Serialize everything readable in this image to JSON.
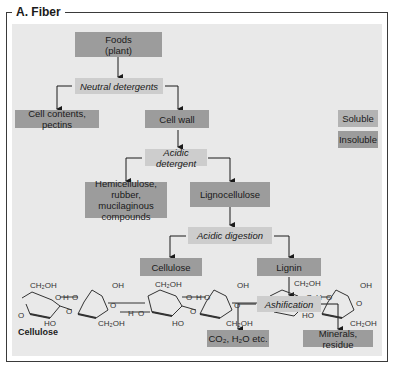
{
  "figure": {
    "title": "A. Fiber",
    "colors": {
      "panel_bg": "#e9e9e9",
      "insoluble_box": "#9c9c9c",
      "soluble_box": "#b3b3b3",
      "process_box": "#cdcdcd",
      "line": "#1a1a1a"
    }
  },
  "nodes": {
    "foods": "Foods\n(plant)",
    "neutral_detergents": "Neutral detergents",
    "cell_contents": "Cell contents, pectins",
    "cell_wall": "Cell wall",
    "acidic_detergent": "Acidic detergent",
    "hemicellulose": "Hemicellulose, rubber, mucilaginous compounds",
    "lignocellulose": "Lignocellulose",
    "acidic_digestion": "Acidic digestion",
    "cellulose": "Cellulose",
    "lignin": "Lignin",
    "ashification": "Ashification",
    "co2_h2o": "CO₂, H₂O etc.",
    "minerals": "Minerals, residue"
  },
  "legend": {
    "soluble": "Soluble",
    "insoluble": "Insoluble"
  },
  "structure": {
    "label": "Cellulose",
    "groups": [
      "CH₂OH",
      "OH",
      "HO",
      "O",
      "O–H–O"
    ]
  },
  "edges": [
    [
      "foods",
      "neutral_detergents"
    ],
    [
      "neutral_detergents",
      "cell_contents"
    ],
    [
      "neutral_detergents",
      "cell_wall"
    ],
    [
      "cell_wall",
      "acidic_detergent"
    ],
    [
      "acidic_detergent",
      "hemicellulose"
    ],
    [
      "acidic_detergent",
      "lignocellulose"
    ],
    [
      "lignocellulose",
      "acidic_digestion"
    ],
    [
      "acidic_digestion",
      "cellulose"
    ],
    [
      "acidic_digestion",
      "lignin"
    ],
    [
      "lignin",
      "ashification"
    ],
    [
      "ashification",
      "co2_h2o"
    ],
    [
      "ashification",
      "minerals"
    ]
  ]
}
